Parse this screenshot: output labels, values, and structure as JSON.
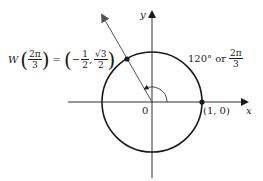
{
  "diagram": {
    "type": "unit-circle",
    "axes": {
      "x_label": "x",
      "y_label": "y"
    },
    "origin_label": "0",
    "point_on_x_axis": "(1, 0)",
    "angle_label": {
      "degrees": "120° or",
      "radians_num": "2π",
      "radians_den": "3"
    },
    "point_W": {
      "prefix": "W",
      "arg_num": "2π",
      "arg_den": "3",
      "equals": "=",
      "x_sign": "−",
      "x_num": "1",
      "x_den": "2",
      "comma": ",",
      "y_num": "√3",
      "y_den": "2"
    },
    "colors": {
      "stroke": "#1a1a1a",
      "arrow": "#555555",
      "background": "#ffffff"
    }
  }
}
